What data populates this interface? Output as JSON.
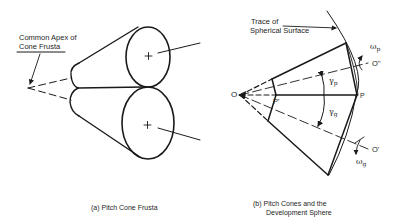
{
  "figure_a": {
    "callout_line1": "Common Apex of",
    "callout_line2": "Cone Frusta",
    "caption": "(a)  Pitch Cone Frusta"
  },
  "figure_b": {
    "callout_line1": "Trace of",
    "callout_line2": "Spherical Surface",
    "point_O": "O",
    "point_P_prime": "P'",
    "point_P": "P",
    "axis_O_double_prime": "O''",
    "axis_O_prime": "O'",
    "gamma_p": "γ",
    "gamma_p_sub": "p",
    "gamma_g": "γ",
    "gamma_g_sub": "g",
    "omega_p": "ω",
    "omega_p_sub": "p",
    "omega_g": "ω",
    "omega_g_sub": "g",
    "caption_line1": "(b)  Pitch Cones and the",
    "caption_line2": "Development Sphere"
  },
  "colors": {
    "ink": "#1a1a1a",
    "background": "#ffffff"
  }
}
